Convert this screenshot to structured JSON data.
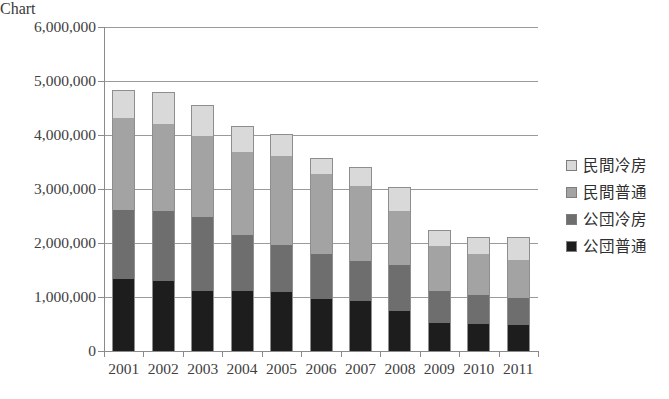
{
  "chart_data": {
    "type": "bar",
    "subtype": "stacked-column",
    "title": "",
    "xlabel": "",
    "ylabel": "",
    "categories": [
      "2001",
      "2002",
      "2003",
      "2004",
      "2005",
      "2006",
      "2007",
      "2008",
      "2009",
      "2010",
      "2011"
    ],
    "series": [
      {
        "name": "公団普通",
        "color": "#1d1d1d",
        "values": [
          1340000,
          1300000,
          1110000,
          1110000,
          1090000,
          960000,
          930000,
          740000,
          520000,
          500000,
          490000
        ]
      },
      {
        "name": "公団冷房",
        "color": "#6e6e6e",
        "values": [
          1280000,
          1300000,
          1370000,
          1040000,
          870000,
          830000,
          740000,
          850000,
          590000,
          530000,
          500000
        ]
      },
      {
        "name": "民間普通",
        "color": "#a3a3a3",
        "values": [
          1700000,
          1600000,
          1500000,
          1540000,
          1660000,
          1490000,
          1390000,
          1010000,
          830000,
          760000,
          690000
        ]
      },
      {
        "name": "民間冷房",
        "color": "#d9d9d9",
        "values": [
          520000,
          600000,
          570000,
          470000,
          390000,
          300000,
          340000,
          440000,
          310000,
          330000,
          440000
        ]
      }
    ],
    "totals": [
      4840000,
      4800000,
      4550000,
      4160000,
      4010000,
      3580000,
      3400000,
      3040000,
      2250000,
      2120000,
      2120000
    ],
    "ylim": [
      0,
      6000000
    ],
    "ytick_values": [
      0,
      1000000,
      2000000,
      3000000,
      4000000,
      5000000,
      6000000
    ],
    "ytick_labels": [
      "0",
      "1,000,000",
      "2,000,000",
      "3,000,000",
      "4,000,000",
      "5,000,000",
      "6,000,000"
    ],
    "grid": true,
    "grid_axis": "y",
    "legend_position": "right",
    "legend_entries": [
      "民間冷房",
      "民間普通",
      "公団冷房",
      "公団普通"
    ],
    "legend_colors": [
      "#d9d9d9",
      "#a3a3a3",
      "#6e6e6e",
      "#1d1d1d"
    ]
  }
}
